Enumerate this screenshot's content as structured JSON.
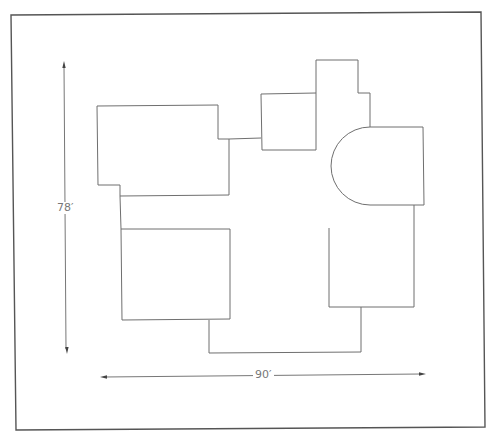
{
  "diagram": {
    "type": "floor-plan",
    "dimensions": {
      "height_label": "78′",
      "width_label": "90′"
    },
    "colors": {
      "background": "#ffffff",
      "frame": "#555555",
      "walls": "#6f6f6f",
      "dimension_lines": "#777777",
      "labels": "#777777"
    },
    "rooms": [
      {
        "name": "upper-left-room"
      },
      {
        "name": "upper-middle-room"
      },
      {
        "name": "upper-tower-room"
      },
      {
        "name": "semicircular-room"
      },
      {
        "name": "lower-left-room"
      },
      {
        "name": "lower-right-room"
      },
      {
        "name": "bottom-connector"
      }
    ]
  }
}
